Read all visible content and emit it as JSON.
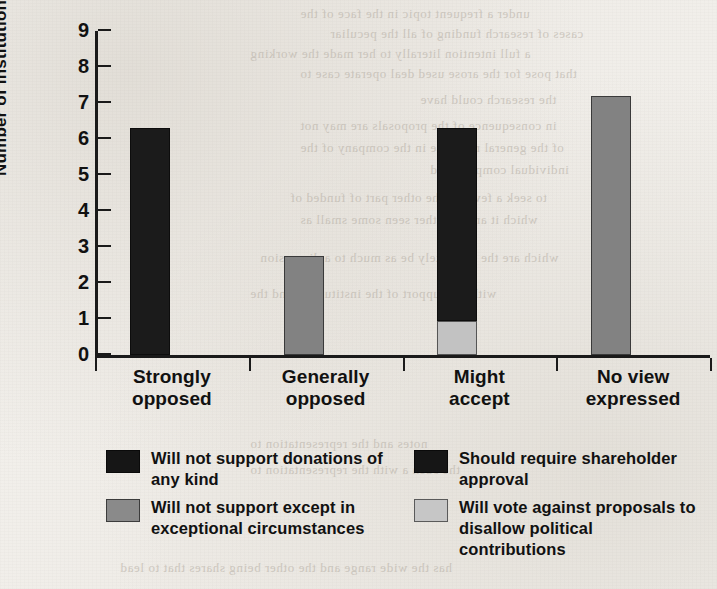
{
  "chart_data": {
    "type": "bar",
    "title": "",
    "xlabel": "",
    "ylabel": "Number of Institutions",
    "ylim": [
      0,
      9
    ],
    "ytick_labels": [
      "0",
      "1",
      "2",
      "3",
      "4",
      "5",
      "6",
      "7",
      "8",
      "9"
    ],
    "grid": false,
    "stacked": true,
    "legend_position": "bottom",
    "categories": [
      "Strongly opposed",
      "Generally opposed",
      "Might accept",
      "No view expressed"
    ],
    "category_lines": [
      [
        "Strongly",
        "opposed"
      ],
      [
        "Generally",
        "opposed"
      ],
      [
        "Might",
        "accept"
      ],
      [
        "No view",
        "expressed"
      ]
    ],
    "series": [
      {
        "name": "Will not support donations of any kind",
        "color": "#1b1b1b",
        "values": [
          6.3,
          0,
          0,
          0
        ]
      },
      {
        "name": "Will not support except in exceptional circumstances",
        "color": "#828282",
        "values": [
          0,
          2.75,
          0,
          0
        ]
      },
      {
        "name": "Should require shareholder approval",
        "color": "#1b1b1b",
        "values": [
          0,
          0,
          5.35,
          0
        ]
      },
      {
        "name": "Will vote against proposals to disallow political contributions",
        "color": "#c2c2c2",
        "values": [
          0,
          0,
          0.95,
          7.2
        ]
      }
    ],
    "bars": [
      {
        "category": "Strongly opposed",
        "total": 6.3,
        "segments": [
          {
            "tone": "black",
            "value": 6.3
          }
        ]
      },
      {
        "category": "Generally opposed",
        "total": 2.75,
        "segments": [
          {
            "tone": "mid",
            "value": 2.75
          }
        ]
      },
      {
        "category": "Might accept",
        "total": 6.3,
        "segments": [
          {
            "tone": "light",
            "value": 0.95
          },
          {
            "tone": "black",
            "value": 5.35
          }
        ]
      },
      {
        "category": "No view expressed",
        "total": 7.2,
        "segments": [
          {
            "tone": "mid",
            "value": 7.2
          }
        ]
      }
    ]
  },
  "legend": {
    "left_column": [
      {
        "tone": "black",
        "label": "Will not support donations of any kind"
      },
      {
        "tone": "mid",
        "label": "Will not support except in exceptional circumstances"
      }
    ],
    "right_column": [
      {
        "tone": "black",
        "label": "Should require shareholder approval"
      },
      {
        "tone": "light",
        "label": "Will vote against proposals to disallow political contributions"
      }
    ]
  },
  "colors": {
    "black": "#1b1b1b",
    "mid_gray": "#828282",
    "light_gray": "#c2c2c2",
    "paper": "#f2f0ec",
    "ink": "#111111"
  },
  "background_bleed": [
    "under a frequent topic in the face of the",
    "cases of research funding of all the peculiar",
    "a full intention literally to her made the working",
    "that pose for the arose used deal operate case to",
    "the research could have",
    "in consequence of the proposals are may not",
    "of the general response in the company of the",
    "individual company and",
    "to seek a few. On the other part of funded of",
    "which it are the other seen some small as",
    "which are the less likely be as much to a discussion",
    "with the support of the institutions and the",
    "notes and the representation to",
    "the such a with the representation to",
    "has the wide range and the other being shares that to lead"
  ]
}
